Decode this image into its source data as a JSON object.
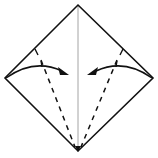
{
  "diagram": {
    "title": "Kite base fold",
    "description": "Square rotated as a diamond; fold left and right edges to the center crease along dashed valley lines.",
    "colors": {
      "outline": "#111111",
      "center_crease": "#9a9a9a",
      "fold_line": "#111111",
      "arrow": "#111111",
      "background": "#ffffff"
    },
    "shape": {
      "top": [
        78,
        5
      ],
      "right": [
        153,
        78
      ],
      "bottom": [
        78,
        151
      ],
      "left": [
        5,
        78
      ]
    },
    "center_crease": {
      "from": [
        78,
        5
      ],
      "to": [
        78,
        151
      ]
    },
    "fold_lines": [
      {
        "side": "left",
        "type": "valley-dashed",
        "from": [
          41,
          60
        ],
        "to": [
          75,
          148
        ]
      },
      {
        "side": "right",
        "type": "valley-dashed",
        "from": [
          115,
          60
        ],
        "to": [
          81,
          148
        ]
      }
    ],
    "arrows": [
      {
        "side": "left",
        "direction": "to-center",
        "from": [
          6,
          78
        ],
        "to": [
          68,
          74
        ]
      },
      {
        "side": "right",
        "direction": "to-center",
        "from": [
          152,
          78
        ],
        "to": [
          88,
          74
        ]
      }
    ],
    "edge_ticks": [
      {
        "side": "left",
        "from": [
          35,
          50
        ],
        "to": [
          38,
          55
        ]
      },
      {
        "side": "right",
        "from": [
          123,
          50
        ],
        "to": [
          120,
          55
        ]
      }
    ]
  }
}
